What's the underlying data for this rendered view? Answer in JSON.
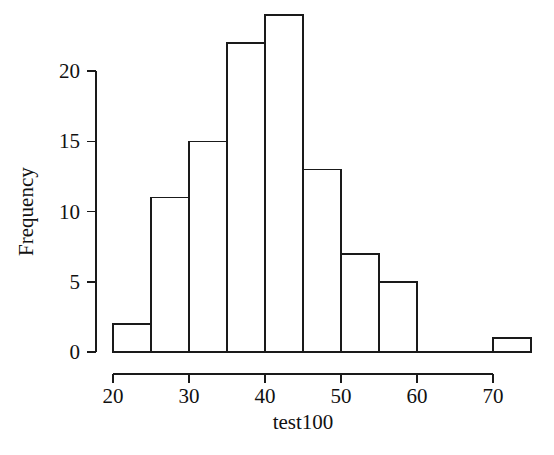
{
  "chart_data": {
    "type": "bar",
    "title": "",
    "subtitle": "",
    "xlabel": "test100",
    "ylabel": "Frequency",
    "bin_width": 5,
    "bin_edges": [
      20,
      25,
      30,
      35,
      40,
      45,
      50,
      55,
      60,
      65,
      70,
      75
    ],
    "categories": [
      "20-25",
      "25-30",
      "30-35",
      "35-40",
      "40-45",
      "45-50",
      "50-55",
      "55-60",
      "60-65",
      "65-70",
      "70-75"
    ],
    "values": [
      2,
      11,
      15,
      22,
      24,
      13,
      7,
      5,
      0,
      0,
      1
    ],
    "bars": [
      {
        "x0": 20,
        "x1": 25,
        "value": 2
      },
      {
        "x0": 25,
        "x1": 30,
        "value": 11
      },
      {
        "x0": 30,
        "x1": 35,
        "value": 15
      },
      {
        "x0": 35,
        "x1": 40,
        "value": 22
      },
      {
        "x0": 40,
        "x1": 45,
        "value": 24
      },
      {
        "x0": 45,
        "x1": 50,
        "value": 13
      },
      {
        "x0": 50,
        "x1": 55,
        "value": 7
      },
      {
        "x0": 55,
        "x1": 60,
        "value": 5
      },
      {
        "x0": 60,
        "x1": 65,
        "value": 0
      },
      {
        "x0": 65,
        "x1": 70,
        "value": 0
      },
      {
        "x0": 70,
        "x1": 75,
        "value": 1
      }
    ],
    "xlim": [
      20,
      75
    ],
    "ylim": [
      0,
      24
    ],
    "xticks": [
      20,
      30,
      40,
      50,
      60,
      70
    ],
    "xtick_labels": [
      "20",
      "30",
      "40",
      "50",
      "60",
      "70"
    ],
    "yticks": [
      0,
      5,
      10,
      15,
      20
    ],
    "ytick_labels": [
      "0",
      "5",
      "10",
      "15",
      "20"
    ],
    "x_axis_range": [
      20,
      70
    ],
    "y_axis_range": [
      0,
      20
    ],
    "grid": false,
    "legend": false,
    "legend_position": "none",
    "bar_fill_color": "#ffffff",
    "bar_edge_color": "#1a1a1a",
    "axis_color": "#1a1a1a",
    "background_color": "#ffffff",
    "total_count": 100
  }
}
